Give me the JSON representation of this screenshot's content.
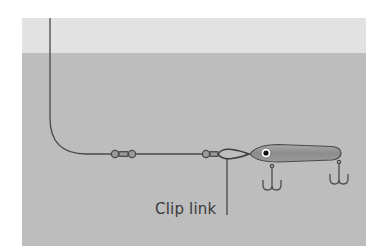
{
  "diagram": {
    "labels": {
      "clip_link": "Clip link"
    },
    "components": [
      "fishing-line",
      "swivel",
      "swivel",
      "clip-link",
      "lure",
      "treble-hook",
      "treble-hook"
    ],
    "colors": {
      "background": "#ffffff",
      "sky_band": "#e2e2e2",
      "water": "#bdbdbd",
      "line": "#4a4a4a",
      "lure_body": "#8f8f8f",
      "lure_eye_ring": "#ffffff",
      "lure_eye_pupil": "#111111"
    }
  }
}
